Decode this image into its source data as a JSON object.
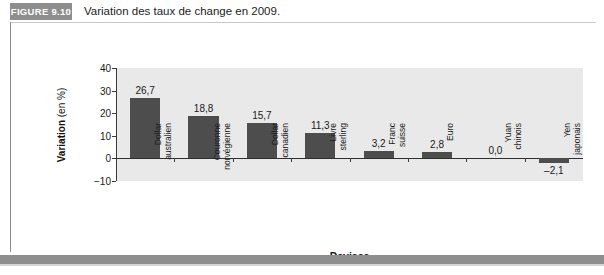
{
  "figure": {
    "badge_label": "FIGURE 9.10",
    "title": "Variation des taux de change en 2009."
  },
  "chart_data": {
    "type": "bar",
    "title": "Variation des taux de change en 2009.",
    "xlabel": "Devises",
    "ylabel": "Variation (en %)",
    "ylabel_main": "Variation",
    "ylabel_unit": " (en %)",
    "ylim": [
      -10,
      40
    ],
    "yticks": [
      40,
      30,
      20,
      10,
      0,
      -10
    ],
    "ytick_labels": [
      "40",
      "30",
      "20",
      "10",
      "0",
      "−10"
    ],
    "grid": false,
    "legend": null,
    "bar_color": "#4d4d4d",
    "plot_background": "#e9e9e9",
    "categories": [
      "Dollar australien",
      "Couronne norvégienne",
      "Dollar canadien",
      "Livre sterling",
      "Franc suisse",
      "Euro",
      "Yuan chinois",
      "Yen japonais"
    ],
    "category_lines": [
      [
        "Dollar",
        "australien"
      ],
      [
        "Couronne",
        "norvégienne"
      ],
      [
        "Dollar",
        "canadien"
      ],
      [
        "Livre",
        "sterling"
      ],
      [
        "Franc",
        "suisse"
      ],
      [
        "Euro",
        ""
      ],
      [
        "Yuan",
        "chinois"
      ],
      [
        "Yen",
        "japonais"
      ]
    ],
    "values": [
      26.7,
      18.8,
      15.7,
      11.3,
      3.2,
      2.8,
      0.0,
      -2.1
    ],
    "value_labels": [
      "26,7",
      "18,8",
      "15,7",
      "11,3",
      "3,2",
      "2,8",
      "0,0",
      "–2,1"
    ]
  }
}
